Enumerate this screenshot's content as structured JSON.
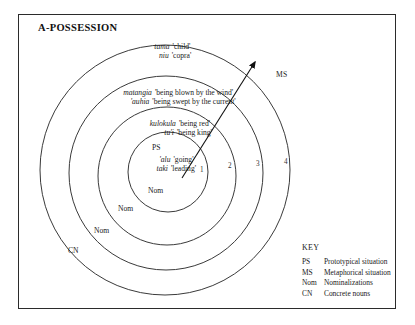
{
  "figure": {
    "title": "A-POSSESSION",
    "ms_label": "MS",
    "key": {
      "heading": "KEY",
      "entries": [
        {
          "abbr": "PS",
          "meaning": "Prototypical situation"
        },
        {
          "abbr": "MS",
          "meaning": "Metaphorical situation"
        },
        {
          "abbr": "Nom",
          "meaning": "Nominalizations"
        },
        {
          "abbr": "CN",
          "meaning": "Concrete nouns"
        }
      ]
    },
    "rings": [
      {
        "number": "1",
        "zone_tag": "Nom",
        "ps_tag": "PS",
        "entries": [
          {
            "term": "'alu",
            "gloss": "'going'"
          },
          {
            "term": "taki",
            "gloss": "'leading'"
          }
        ]
      },
      {
        "number": "2",
        "zone_tag": "Nom",
        "entries": [
          {
            "term": "kulokula",
            "gloss": "'being red'"
          },
          {
            "term": "tu'i",
            "gloss": "'being king'"
          }
        ]
      },
      {
        "number": "3",
        "zone_tag": "Nom",
        "entries": [
          {
            "term": "matangia",
            "gloss": "'being blown by the wind'"
          },
          {
            "term": "'auhia",
            "gloss": "'being swept by the current'"
          }
        ]
      },
      {
        "number": "4",
        "zone_tag": "CN",
        "entries": [
          {
            "term": "tama",
            "gloss": "'child'"
          },
          {
            "term": "niu",
            "gloss": "'copra'"
          }
        ]
      }
    ]
  }
}
